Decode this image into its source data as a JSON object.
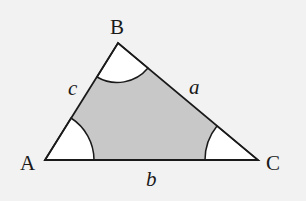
{
  "diagram": {
    "type": "triangle",
    "vertices": {
      "A": {
        "label": "A"
      },
      "B": {
        "label": "B"
      },
      "C": {
        "label": "C"
      }
    },
    "sides": {
      "a": {
        "label": "a",
        "between": [
          "B",
          "C"
        ]
      },
      "b": {
        "label": "b",
        "between": [
          "A",
          "C"
        ]
      },
      "c": {
        "label": "c",
        "between": [
          "A",
          "B"
        ]
      }
    },
    "angle_markers": [
      "A",
      "B",
      "C"
    ],
    "colors": {
      "background": "#f2f2f2",
      "triangle_fill": "#c8c8c8",
      "angle_fill": "#ffffff",
      "stroke": "#1a1a1a"
    }
  }
}
